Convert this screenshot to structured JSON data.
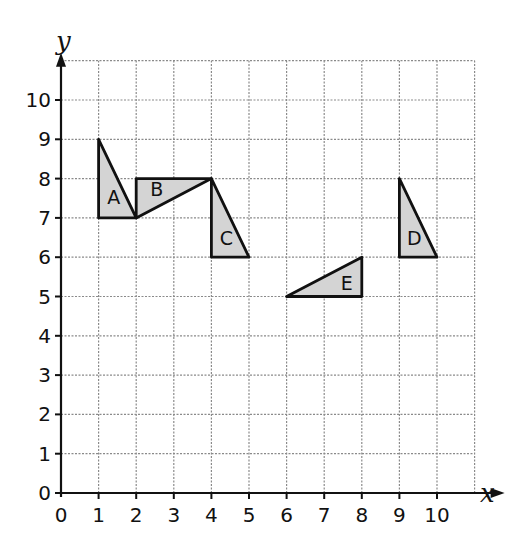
{
  "chart_data": {
    "type": "diagram",
    "title": "",
    "xlabel": "x",
    "ylabel": "y",
    "xlim": [
      0,
      11
    ],
    "ylim": [
      0,
      11
    ],
    "x_ticks": [
      "0",
      "1",
      "2",
      "3",
      "4",
      "5",
      "6",
      "7",
      "8",
      "9",
      "10"
    ],
    "y_ticks": [
      "0",
      "1",
      "2",
      "3",
      "4",
      "5",
      "6",
      "7",
      "8",
      "9",
      "10"
    ],
    "grid": true,
    "shapes": [
      {
        "label": "A",
        "vertices": [
          [
            1,
            9
          ],
          [
            1,
            7
          ],
          [
            2,
            7
          ]
        ],
        "label_pos": [
          1.4,
          7.5
        ]
      },
      {
        "label": "B",
        "vertices": [
          [
            2,
            8
          ],
          [
            4,
            8
          ],
          [
            2,
            7
          ]
        ],
        "label_pos": [
          2.55,
          7.7
        ]
      },
      {
        "label": "C",
        "vertices": [
          [
            4,
            8
          ],
          [
            4,
            6
          ],
          [
            5,
            6
          ]
        ],
        "label_pos": [
          4.4,
          6.45
        ]
      },
      {
        "label": "D",
        "vertices": [
          [
            9,
            8
          ],
          [
            9,
            6
          ],
          [
            10,
            6
          ]
        ],
        "label_pos": [
          9.4,
          6.45
        ]
      },
      {
        "label": "E",
        "vertices": [
          [
            6,
            5
          ],
          [
            8,
            5
          ],
          [
            8,
            6
          ]
        ],
        "label_pos": [
          7.6,
          5.3
        ]
      }
    ],
    "fill_color": "#d4d4d4",
    "stroke_color": "#111111"
  }
}
